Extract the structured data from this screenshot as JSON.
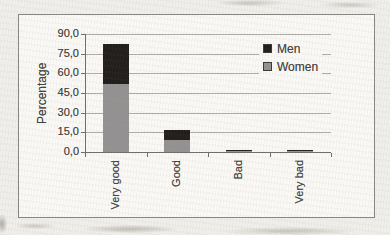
{
  "chart_data": {
    "type": "bar",
    "stacked": true,
    "title": "",
    "ylabel": "Percentage",
    "xlabel": "",
    "categories": [
      "Very good",
      "Good",
      "Bad",
      "Very bad"
    ],
    "series": [
      {
        "name": "Men",
        "color": "#211e1b",
        "values": [
          30,
          8,
          1,
          1
        ]
      },
      {
        "name": "Women",
        "color": "#949292",
        "values": [
          52,
          9,
          0.5,
          0.5
        ]
      }
    ],
    "stack_order_bottom_to_top": [
      "Women",
      "Men"
    ],
    "ylim": [
      0,
      90
    ],
    "ytick_values": [
      90,
      75,
      60,
      45,
      30,
      15,
      0
    ],
    "ytick_labels": [
      "90,0",
      "75,0",
      "60,0",
      "45,0",
      "30,0",
      "15,0",
      "0,0"
    ],
    "grid": true,
    "legend": {
      "position": "upper-right",
      "entries": [
        "Men",
        "Women"
      ]
    }
  },
  "colors": {
    "page_bg": "#f1efeb",
    "chart_bg": "#faf9f6",
    "frame_border": "#8a8782",
    "gridline": "#b0ada7",
    "axis": "#716e69",
    "text": "#45423e",
    "men": "#211e1b",
    "women": "#949292"
  }
}
